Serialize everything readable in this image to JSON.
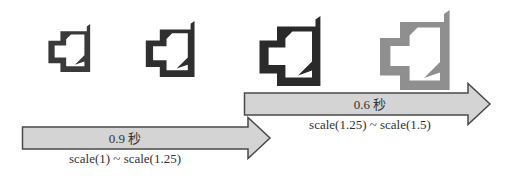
{
  "icons": [
    {
      "name": "icon-scale-1",
      "color": "#3a3a3a"
    },
    {
      "name": "icon-scale-1-25",
      "color": "#2f2f2f"
    },
    {
      "name": "icon-scale-1-25-b",
      "color": "#2a2a2a"
    },
    {
      "name": "icon-scale-1-5",
      "color": "#8f8f8f"
    }
  ],
  "arrows": [
    {
      "duration": "0.9 秒",
      "range": "scale(1) ~ scale(1.25)",
      "fill": "#d4d4d4",
      "stroke": "#4a4a4a"
    },
    {
      "duration": "0.6 秒",
      "range": "scale(1.25) ~ scale(1.5)",
      "fill": "#d4d4d4",
      "stroke": "#4a4a4a"
    }
  ]
}
